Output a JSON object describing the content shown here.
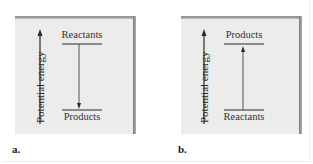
{
  "figure": {
    "panels": [
      {
        "letter": "a.",
        "axis_label": "Potential energy",
        "top_level": "Reactants",
        "bottom_level": "Products",
        "arrow_direction": "down",
        "description": "Exothermic: reactants at higher potential energy than products"
      },
      {
        "letter": "b.",
        "axis_label": "Potential energy",
        "top_level": "Products",
        "bottom_level": "Reactants",
        "arrow_direction": "up",
        "description": "Endothermic: products at higher potential energy than reactants"
      }
    ],
    "colors": {
      "panel_bg": "#ececec",
      "line": "#2a2a2a",
      "shadow": "#8a8a8a"
    }
  }
}
